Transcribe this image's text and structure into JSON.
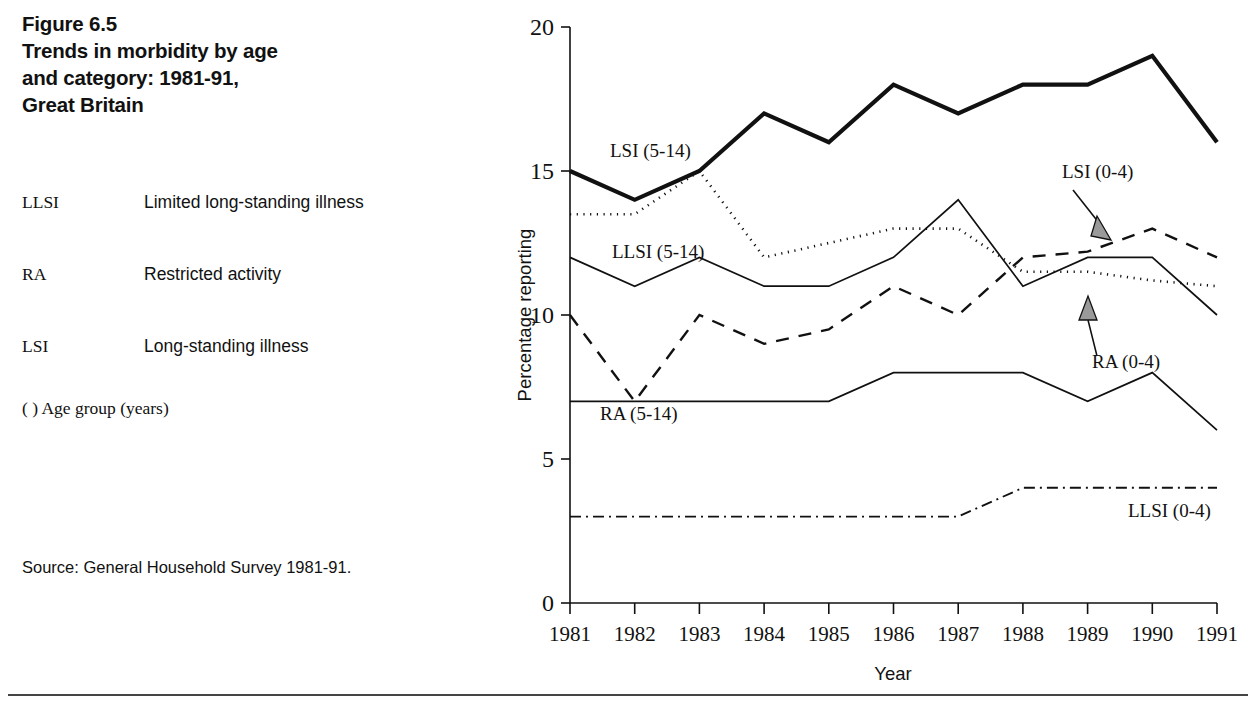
{
  "figure": {
    "title_lines": [
      "Figure 6.5",
      "Trends in morbidity by age",
      "and category: 1981-91,",
      "Great Britain"
    ],
    "title_line_1": "Figure 6.5",
    "title_line_2": "Trends in morbidity by age",
    "title_line_3": "and category: 1981-91,",
    "title_line_4": "Great Britain",
    "source": "Source: General Household Survey 1981-91.",
    "age_group_note": "(   ) Age group (years)"
  },
  "legend": {
    "rows": [
      {
        "abbr": "LLSI",
        "definition": "Limited long-standing illness"
      },
      {
        "abbr": "RA",
        "definition": "Restricted activity"
      },
      {
        "abbr": "LSI",
        "definition": "Long-standing illness"
      }
    ]
  },
  "chart_data": {
    "type": "line",
    "title": "Trends in morbidity by age and category: 1981-91, Great Britain",
    "xlabel": "Year",
    "ylabel": "Percentage reporting",
    "categories": [
      "1981",
      "1982",
      "1983",
      "1984",
      "1985",
      "1986",
      "1987",
      "1988",
      "1989",
      "1990",
      "1991"
    ],
    "x": [
      1981,
      1982,
      1983,
      1984,
      1985,
      1986,
      1987,
      1988,
      1989,
      1990,
      1991
    ],
    "xlim": [
      1981,
      1991
    ],
    "ylim": [
      0,
      20
    ],
    "yticks": [
      0,
      5,
      10,
      15,
      20
    ],
    "ytick_labels": [
      "0",
      "5",
      "10",
      "15",
      "20"
    ],
    "grid": false,
    "legend_position": "in-plot labels",
    "series": [
      {
        "name": "LSI (5-14)",
        "label": "LSI (5-14)",
        "style": "solid-bold",
        "values": [
          15,
          14,
          15,
          17,
          16,
          18,
          17,
          18,
          18,
          19,
          16
        ],
        "label_x": 610,
        "label_y": 157
      },
      {
        "name": "LLSI (5-14)",
        "label": "LLSI (5-14)",
        "style": "dotted",
        "values": [
          13.5,
          13.5,
          15,
          12,
          12.5,
          13,
          13,
          11.5,
          11.5,
          11.2,
          11
        ],
        "label_x": 612,
        "label_y": 258
      },
      {
        "name": "RA (0-4)",
        "label": "RA (0-4)",
        "style": "solid-thin",
        "values": [
          12,
          11,
          12,
          11,
          11,
          12,
          14,
          11,
          12,
          12,
          10
        ],
        "label_x": 1092,
        "label_y": 368,
        "annotation": "arrow-up"
      },
      {
        "name": "LSI (0-4)",
        "label": "LSI (0-4)",
        "style": "dashed",
        "values": [
          10,
          7,
          10,
          9,
          9.5,
          11,
          10,
          12,
          12.2,
          13,
          12
        ],
        "label_x": 1062,
        "label_y": 178,
        "annotation": "arrow-down"
      },
      {
        "name": "RA (5-14)",
        "label": "RA (5-14)",
        "style": "solid-thin",
        "values": [
          7,
          7,
          7,
          7,
          7,
          8,
          8,
          8,
          7,
          8,
          6
        ],
        "label_x": 600,
        "label_y": 420
      },
      {
        "name": "LLSI (0-4)",
        "label": "LLSI (0-4)",
        "style": "dash-dot",
        "values": [
          3,
          3,
          3,
          3,
          3,
          3,
          3,
          4,
          4,
          4,
          4
        ],
        "label_x": 1128,
        "label_y": 517
      }
    ]
  }
}
